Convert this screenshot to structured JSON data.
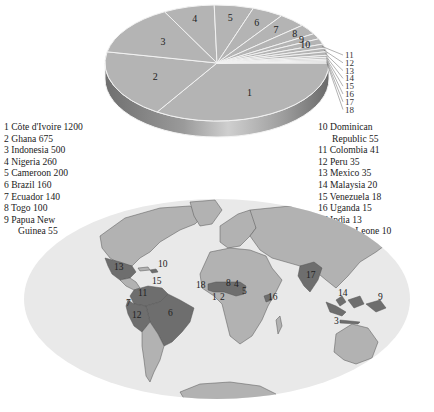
{
  "chart_data": {
    "type": "pie",
    "title": "",
    "style": "3d",
    "unit": "",
    "categories": [
      "Côte d'Ivoire",
      "Ghana",
      "Indonesia",
      "Nigeria",
      "Cameroon",
      "Brazil",
      "Ecuador",
      "Togo",
      "Papua New Guinea",
      "Dominican Republic",
      "Colombia",
      "Peru",
      "Mexico",
      "Malaysia",
      "Venezuela",
      "Uganda",
      "India",
      "Sierra Leone"
    ],
    "values": [
      1200,
      675,
      500,
      260,
      200,
      160,
      140,
      100,
      55,
      55,
      41,
      35,
      35,
      20,
      18,
      15,
      13,
      10
    ],
    "slice_labels": [
      "1",
      "2",
      "3",
      "4",
      "5",
      "6",
      "7",
      "8",
      "9",
      "10",
      "11",
      "12",
      "13",
      "14",
      "15",
      "16",
      "17",
      "18"
    ],
    "direction": "counter-clockwise from east",
    "colors": {
      "slice_fill": "#b4b4b4",
      "slice_edge": "#f2f2f2",
      "side_dark": "#7a7a7a",
      "side_light": "#c8c8c8"
    }
  },
  "legend": {
    "left": [
      {
        "num": "1",
        "name": "Côte d'Ivoire",
        "value": "1200"
      },
      {
        "num": "2",
        "name": "Ghana",
        "value": "675"
      },
      {
        "num": "3",
        "name": "Indonesia",
        "value": "500"
      },
      {
        "num": "4",
        "name": "Nigeria",
        "value": "260"
      },
      {
        "num": "5",
        "name": "Cameroon",
        "value": "200"
      },
      {
        "num": "6",
        "name": "Brazil",
        "value": "160"
      },
      {
        "num": "7",
        "name": "Ecuador",
        "value": "140"
      },
      {
        "num": "8",
        "name": "Togo",
        "value": "100"
      },
      {
        "num": "9",
        "name": "Papua New",
        "value": "",
        "cont": "Guinea 55"
      }
    ],
    "right": [
      {
        "num": "10",
        "name": "Dominican",
        "value": "",
        "cont": "Republic 55"
      },
      {
        "num": "11",
        "name": "Colombia",
        "value": "41"
      },
      {
        "num": "12",
        "name": "Peru",
        "value": "35"
      },
      {
        "num": "13",
        "name": "Mexico",
        "value": "35"
      },
      {
        "num": "14",
        "name": "Malaysia",
        "value": "20"
      },
      {
        "num": "15",
        "name": "Venezuela",
        "value": "18"
      },
      {
        "num": "16",
        "name": "Uganda",
        "value": "15"
      },
      {
        "num": "17",
        "name": "India",
        "value": "13"
      },
      {
        "num": "18",
        "name": "Sierra Leone",
        "value": "10"
      }
    ]
  },
  "map": {
    "colors": {
      "ocean": "#e9e9e9",
      "land": "#b2b2b2",
      "highlight": "#6e6e6e",
      "border": "#555555"
    },
    "labels": [
      {
        "text": "13",
        "country": "Mexico"
      },
      {
        "text": "10",
        "country": "Dominican Republic"
      },
      {
        "text": "15",
        "country": "Venezuela"
      },
      {
        "text": "11",
        "country": "Colombia"
      },
      {
        "text": "7",
        "country": "Ecuador"
      },
      {
        "text": "12",
        "country": "Peru"
      },
      {
        "text": "6",
        "country": "Brazil"
      },
      {
        "text": "18",
        "country": "Sierra Leone"
      },
      {
        "text": "1",
        "country": "Côte d'Ivoire"
      },
      {
        "text": "2",
        "country": "Ghana"
      },
      {
        "text": "8",
        "country": "Togo"
      },
      {
        "text": "4",
        "country": "Nigeria"
      },
      {
        "text": "5",
        "country": "Cameroon"
      },
      {
        "text": "16",
        "country": "Uganda"
      },
      {
        "text": "17",
        "country": "India"
      },
      {
        "text": "14",
        "country": "Malaysia"
      },
      {
        "text": "3",
        "country": "Indonesia"
      },
      {
        "text": "9",
        "country": "Papua New Guinea"
      }
    ]
  }
}
